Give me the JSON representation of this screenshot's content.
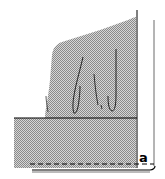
{
  "figure": {
    "label": "a",
    "colors": {
      "fill": "#b8b8b8",
      "stroke": "#000000",
      "background": "#ffffff"
    },
    "elements": [
      "stippled-upper-region",
      "stippled-lower-block",
      "horizontal-divider-line",
      "right-vertical-frame-line",
      "dashed-bottom-line",
      "curved-strokes"
    ]
  }
}
